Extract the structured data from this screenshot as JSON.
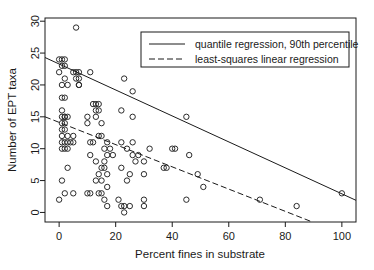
{
  "chart_data": {
    "type": "scatter",
    "title": "",
    "xlabel": "Percent fines in substrate",
    "ylabel": "Number of EPT taxa",
    "xlim": [
      -5,
      105
    ],
    "ylim": [
      -1.5,
      30.5
    ],
    "xticks": [
      0,
      20,
      40,
      60,
      80,
      100
    ],
    "yticks": [
      0,
      5,
      10,
      15,
      20,
      25,
      30
    ],
    "xtick_labels": [
      "0",
      "20",
      "40",
      "60",
      "80",
      "100"
    ],
    "ytick_labels": [
      "0",
      "5",
      "10",
      "15",
      "20",
      "25",
      "30"
    ],
    "grid": false,
    "legend_position": "top-right",
    "points": [
      [
        6,
        29
      ],
      [
        0,
        24
      ],
      [
        1,
        24
      ],
      [
        2,
        24
      ],
      [
        1,
        23
      ],
      [
        2,
        23
      ],
      [
        0,
        22
      ],
      [
        5,
        22
      ],
      [
        6,
        22
      ],
      [
        7,
        22
      ],
      [
        11,
        22
      ],
      [
        7,
        21
      ],
      [
        6,
        21
      ],
      [
        23,
        21
      ],
      [
        2,
        21
      ],
      [
        7,
        20
      ],
      [
        7,
        20
      ],
      [
        1,
        20
      ],
      [
        3,
        20
      ],
      [
        26,
        19
      ],
      [
        1,
        18
      ],
      [
        2,
        18
      ],
      [
        12,
        17
      ],
      [
        13,
        17
      ],
      [
        14,
        17
      ],
      [
        14,
        16
      ],
      [
        22,
        16
      ],
      [
        1,
        16
      ],
      [
        13,
        16
      ],
      [
        1,
        15
      ],
      [
        2,
        15
      ],
      [
        2,
        15
      ],
      [
        3,
        15
      ],
      [
        10,
        15
      ],
      [
        13,
        15
      ],
      [
        26,
        15
      ],
      [
        45,
        15
      ],
      [
        1,
        14
      ],
      [
        2,
        14
      ],
      [
        10,
        14
      ],
      [
        15,
        14
      ],
      [
        1,
        13
      ],
      [
        2,
        13
      ],
      [
        14,
        12
      ],
      [
        15,
        12
      ],
      [
        1,
        12
      ],
      [
        3,
        12
      ],
      [
        5,
        12
      ],
      [
        1,
        11
      ],
      [
        2,
        11
      ],
      [
        3,
        11
      ],
      [
        4,
        11
      ],
      [
        5,
        11
      ],
      [
        11,
        11
      ],
      [
        12,
        11
      ],
      [
        17,
        11
      ],
      [
        22,
        11
      ],
      [
        26,
        11
      ],
      [
        1,
        10
      ],
      [
        2,
        10
      ],
      [
        3,
        10
      ],
      [
        16,
        10
      ],
      [
        18,
        10
      ],
      [
        24,
        10
      ],
      [
        32,
        10
      ],
      [
        40,
        10
      ],
      [
        41,
        10
      ],
      [
        26,
        9
      ],
      [
        17,
        9
      ],
      [
        19,
        9
      ],
      [
        28,
        9
      ],
      [
        46,
        9
      ],
      [
        11,
        9
      ],
      [
        27,
        8
      ],
      [
        30,
        8
      ],
      [
        13,
        8
      ],
      [
        16,
        8
      ],
      [
        15,
        7
      ],
      [
        16,
        7
      ],
      [
        3,
        7
      ],
      [
        22,
        7
      ],
      [
        37,
        7
      ],
      [
        38,
        7
      ],
      [
        14,
        6
      ],
      [
        17,
        6
      ],
      [
        25,
        6
      ],
      [
        30,
        6
      ],
      [
        1,
        5
      ],
      [
        13,
        5
      ],
      [
        15,
        5
      ],
      [
        24,
        5
      ],
      [
        49,
        6
      ],
      [
        51,
        4
      ],
      [
        17,
        4
      ],
      [
        2,
        3
      ],
      [
        5,
        3
      ],
      [
        10,
        3
      ],
      [
        11,
        3
      ],
      [
        14,
        3
      ],
      [
        15,
        3
      ],
      [
        45,
        2
      ],
      [
        0,
        2
      ],
      [
        16,
        2
      ],
      [
        21,
        2
      ],
      [
        30,
        2
      ],
      [
        30,
        1
      ],
      [
        17,
        1
      ],
      [
        22,
        1
      ],
      [
        23,
        1
      ],
      [
        25,
        1
      ],
      [
        71,
        2
      ],
      [
        84,
        1
      ],
      [
        100,
        3
      ],
      [
        23,
        0
      ]
    ],
    "series": [
      {
        "name": "quantile regression, 90th percentile",
        "style": "solid",
        "x": [
          -5,
          105
        ],
        "y": [
          24.3,
          1.9
        ]
      },
      {
        "name": "least-squares linear regression",
        "style": "dashed",
        "x": [
          -5,
          89
        ],
        "y": [
          15.0,
          -1.4
        ]
      }
    ],
    "legend": [
      {
        "label": "quantile regression, 90th percentile",
        "style": "solid"
      },
      {
        "label": "least-squares linear regression",
        "style": "dashed"
      }
    ]
  }
}
